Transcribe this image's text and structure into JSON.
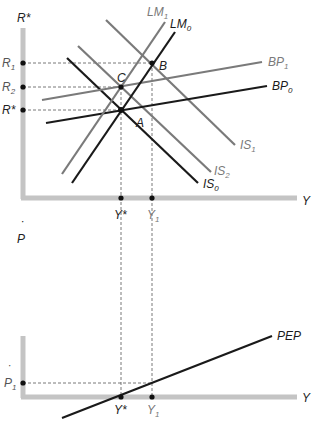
{
  "colors": {
    "axis": "#c4c4c4",
    "black_curve": "#1a1a1a",
    "gray_curve": "#7a7a7a",
    "gray_label": "#7a7a7a",
    "guide": "#555555"
  },
  "top_panel": {
    "y_axis_label": "R*",
    "x_axis_label": "Y",
    "y_ticks": [
      {
        "main": "R",
        "sub": "1"
      },
      {
        "main": "R",
        "sub": "2"
      },
      {
        "main": "R*",
        "sub": ""
      }
    ],
    "x_ticks": [
      {
        "main": "Y*",
        "sub": ""
      },
      {
        "main": "Y",
        "sub": "1"
      }
    ],
    "points": [
      {
        "label": "A"
      },
      {
        "label": "B"
      },
      {
        "label": "C"
      }
    ],
    "curves": [
      {
        "name": "LM",
        "sub": "1",
        "style": "gray"
      },
      {
        "name": "LM",
        "sub": "0",
        "style": "black"
      },
      {
        "name": "BP",
        "sub": "1",
        "style": "gray"
      },
      {
        "name": "BP",
        "sub": "0",
        "style": "black"
      },
      {
        "name": "IS",
        "sub": "1",
        "style": "gray"
      },
      {
        "name": "IS",
        "sub": "2",
        "style": "gray"
      },
      {
        "name": "IS",
        "sub": "0",
        "style": "black"
      }
    ]
  },
  "bottom_panel": {
    "y_axis_label": "P",
    "y_axis_dot": "˙",
    "x_axis_label": "Y",
    "y_ticks": [
      {
        "main": "P",
        "sub": "1",
        "dot": "˙"
      }
    ],
    "x_ticks": [
      {
        "main": "Y*",
        "sub": ""
      },
      {
        "main": "Y",
        "sub": "1"
      }
    ],
    "curves": [
      {
        "name": "PEP",
        "style": "black"
      }
    ]
  }
}
